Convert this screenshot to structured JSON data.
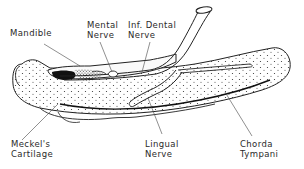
{
  "diagram": {
    "labels": {
      "mandible": {
        "line1": "Mandible"
      },
      "mental_nerve": {
        "line1": "Mental",
        "line2": "Nerve"
      },
      "inf_dental_nerve": {
        "line1": "Inf. Dental",
        "line2": "Nerve"
      },
      "meckels_cartilage": {
        "line1": "Meckel's",
        "line2": "Cartilage"
      },
      "lingual_nerve": {
        "line1": "Lingual",
        "line2": "Nerve"
      },
      "chorda_tympani": {
        "line1": "Chorda",
        "line2": "Tympani"
      }
    },
    "colors": {
      "ink": "#222222",
      "background": "#ffffff"
    }
  }
}
